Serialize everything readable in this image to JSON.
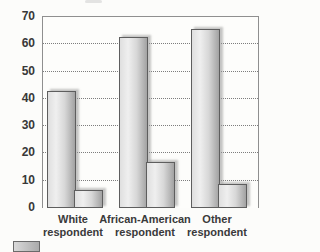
{
  "chart_data": {
    "type": "bar",
    "title": "",
    "xlabel": "",
    "ylabel": "",
    "categories": [
      "White\nrespondent",
      "African-American\nrespondent",
      "Other\nrespondent"
    ],
    "series": [
      {
        "name": "series-1-tall",
        "values": [
          42,
          62,
          65
        ]
      },
      {
        "name": "series-2-short",
        "values": [
          6,
          16,
          8
        ]
      }
    ],
    "ylim": [
      0,
      70
    ],
    "yticks": [
      0,
      10,
      20,
      30,
      40,
      50,
      60,
      70
    ],
    "grid": "horizontal dotted gridlines at 10-60; solid top border at 70",
    "legend": "legend swatch partially cut off at bottom-left edge",
    "colors": {
      "bar_fill_light": "#efefef",
      "bar_fill_dark": "#a2a2a2",
      "bar_border": "#5e5e5e",
      "gridline": "#7d7d7d",
      "axis_border": "#8f8f8f",
      "tick_text": "#383838",
      "label_text": "#3a3a3a",
      "background": "#fcfcfa"
    }
  }
}
